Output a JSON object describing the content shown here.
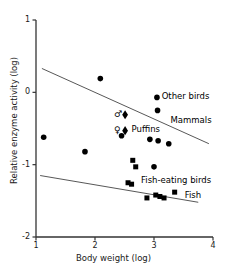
{
  "chart_data": {
    "type": "scatter",
    "title": "",
    "xlabel": "Body weight (log)",
    "ylabel": "Relative enzyme activity (log)",
    "xlim": [
      1,
      4
    ],
    "ylim": [
      -2,
      1
    ],
    "xticks": [
      "1",
      "2",
      "3",
      "4"
    ],
    "yticks": [
      "1",
      "0",
      "-1",
      "-2"
    ],
    "xtick_values": [
      1,
      2,
      3,
      4
    ],
    "ytick_values": [
      1,
      0,
      -1,
      -2
    ],
    "grid": false,
    "legend_position": "inline-annotations",
    "series": [
      {
        "name": "Other birds",
        "marker": "filled-circle",
        "color": "#000000",
        "points": [
          {
            "x": 1.13,
            "y": -0.62
          },
          {
            "x": 1.83,
            "y": -0.82
          },
          {
            "x": 2.09,
            "y": 0.19
          },
          {
            "x": 2.45,
            "y": -0.6
          },
          {
            "x": 2.93,
            "y": -0.65
          },
          {
            "x": 3.05,
            "y": -0.07
          },
          {
            "x": 3.06,
            "y": -0.25
          },
          {
            "x": 3.07,
            "y": -0.67
          },
          {
            "x": 3.0,
            "y": -1.03
          },
          {
            "x": 3.25,
            "y": -0.71
          }
        ]
      },
      {
        "name": "Puffins",
        "marker": "filled-diamond",
        "color": "#000000",
        "points": [
          {
            "x": 2.51,
            "y": -0.31,
            "sex": "male"
          },
          {
            "x": 2.51,
            "y": -0.53,
            "sex": "female"
          }
        ]
      },
      {
        "name": "Fish-eating birds",
        "marker": "filled-square",
        "color": "#000000",
        "points": [
          {
            "x": 2.56,
            "y": -1.25
          },
          {
            "x": 2.62,
            "y": -1.27
          },
          {
            "x": 2.64,
            "y": -0.94
          },
          {
            "x": 2.69,
            "y": -1.03
          },
          {
            "x": 2.88,
            "y": -1.46
          },
          {
            "x": 3.03,
            "y": -1.42
          },
          {
            "x": 3.1,
            "y": -1.44
          },
          {
            "x": 3.17,
            "y": -1.46
          },
          {
            "x": 3.35,
            "y": -1.38
          }
        ]
      }
    ],
    "trendlines": [
      {
        "name": "Mammals",
        "label": "Mammals",
        "x0": 1.1,
        "y0": 0.33,
        "x1": 3.93,
        "y1": -0.71
      },
      {
        "name": "Fish",
        "label": "Fish",
        "x0": 1.07,
        "y0": -1.15,
        "x1": 3.75,
        "y1": -1.52
      }
    ],
    "annotations": [
      {
        "name": "other-birds-label",
        "text": "Other birds",
        "x": 3.13,
        "y": -0.07
      },
      {
        "name": "mammals-label",
        "text": "Mammals",
        "x": 3.28,
        "y": -0.39
      },
      {
        "name": "puffins-label",
        "text": "Puffins",
        "x": 2.62,
        "y": -0.52
      },
      {
        "name": "fish-eating-birds-label",
        "text": "Fish-eating birds",
        "x": 2.78,
        "y": -1.22
      },
      {
        "name": "fish-label",
        "text": "Fish",
        "x": 3.52,
        "y": -1.43
      }
    ],
    "symbols": {
      "male": "♂",
      "female": "♀"
    }
  }
}
